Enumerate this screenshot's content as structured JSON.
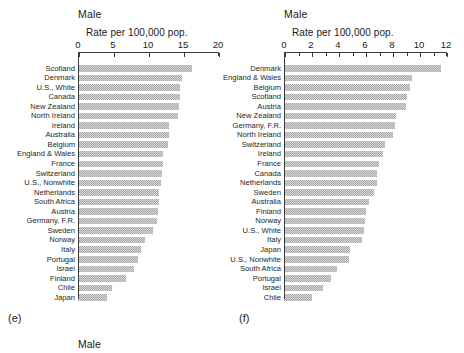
{
  "figure": {
    "captions": {
      "left": "(e)",
      "right": "(f)"
    },
    "bottom_label": "Male"
  },
  "chart_data": [
    {
      "type": "bar",
      "panel": "(e)",
      "title": "Male",
      "xlabel": "Rate per 100,000 pop.",
      "ylabel": "",
      "orientation": "horizontal",
      "xlim": [
        0,
        20
      ],
      "xticks": [
        0,
        5,
        10,
        15,
        20
      ],
      "xticklabels": [
        "0",
        "5",
        "10",
        "15",
        "20"
      ],
      "grid": false,
      "legend": "none",
      "categories": [
        "Scotland",
        "Denmark",
        "U.S., White",
        "Canada",
        "New Zealand",
        "North Ireland",
        "Ireland",
        "Australia",
        "Belgium",
        "England & Wales",
        "France",
        "Switzerland",
        "U.S., Nonwhite",
        "Netherlands",
        "South Africa",
        "Austria",
        "Germany, F.R.",
        "Sweden",
        "Norway",
        "Italy",
        "Portugal",
        "Israel",
        "Finland",
        "Chile",
        "Japan"
      ],
      "values": [
        16.3,
        14.9,
        14.6,
        14.5,
        14.4,
        14.3,
        13.0,
        13.0,
        12.9,
        12.2,
        12.1,
        12.0,
        11.9,
        11.6,
        11.5,
        11.4,
        11.3,
        10.7,
        9.6,
        9.0,
        8.6,
        8.0,
        6.9,
        4.9,
        4.2
      ]
    },
    {
      "type": "bar",
      "panel": "(f)",
      "title": "Male",
      "xlabel": "Rate per 100,000 pop.",
      "ylabel": "",
      "orientation": "horizontal",
      "xlim": [
        0,
        12
      ],
      "xticks": [
        0,
        2,
        4,
        6,
        8,
        10,
        12
      ],
      "xticklabels": [
        "0",
        "2",
        "4",
        "6",
        "8",
        "10",
        "12"
      ],
      "minor_tick_step": 1,
      "grid": false,
      "legend": "none",
      "categories": [
        "Denmark",
        "England & Wales",
        "Belgium",
        "Scotland",
        "Austria",
        "New Zealand",
        "Germany, F.R.",
        "North Ireland",
        "Switzerland",
        "Ireland",
        "France",
        "Canada",
        "Netherlands",
        "Sweden",
        "Australia",
        "Finland",
        "Norway",
        "U.S., White",
        "Italy",
        "Japan",
        "U.S., Nonwhite",
        "South Africa",
        "Portugal",
        "Israel",
        "Chile"
      ],
      "values": [
        11.6,
        9.5,
        9.3,
        9.1,
        9.0,
        8.3,
        8.2,
        8.1,
        7.5,
        7.3,
        7.0,
        6.9,
        6.9,
        6.7,
        6.3,
        6.1,
        6.0,
        5.9,
        5.8,
        4.9,
        4.8,
        3.9,
        3.5,
        2.9,
        2.1
      ]
    }
  ]
}
